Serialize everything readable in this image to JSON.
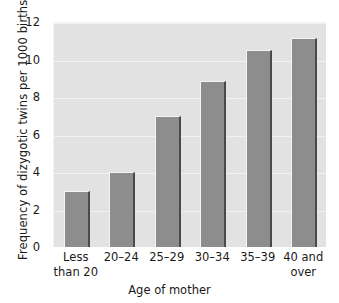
{
  "chart_data": {
    "type": "bar",
    "title": "",
    "xlabel": "Age of mother",
    "ylabel": "Frequency of dizygotic twins per 1000 births",
    "categories": [
      "Less than 20",
      "20–24",
      "25–29",
      "30–34",
      "35–39",
      "40 and over"
    ],
    "category_lines": [
      [
        "Less",
        "than 20"
      ],
      [
        "20–24",
        ""
      ],
      [
        "25–29",
        ""
      ],
      [
        "30–34",
        ""
      ],
      [
        "35–39",
        ""
      ],
      [
        "40 and",
        "over"
      ]
    ],
    "values": [
      3.0,
      4.0,
      7.0,
      8.85,
      10.5,
      11.15
    ],
    "ylim": [
      0,
      12
    ],
    "yticks": [
      0,
      2,
      4,
      6,
      8,
      10,
      12
    ],
    "ytick_labels": [
      "0",
      "2",
      "4",
      "6",
      "8",
      "10",
      "12"
    ],
    "grid": true,
    "grid_axis": "y",
    "legend": false,
    "colors": {
      "bar_fill": "#8d8d8d",
      "bar_highlight": "#f4f4f4",
      "bar_shadow": "#4a4a4a",
      "plot_background": "#e2e2e2",
      "gridline": "#f2f2f2",
      "text": "#1a1a1a",
      "figure_background": "#ffffff"
    }
  }
}
